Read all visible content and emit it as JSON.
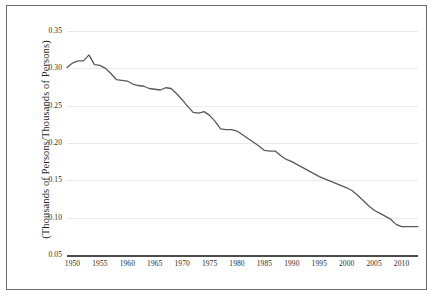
{
  "chart_data": {
    "type": "line",
    "title": "",
    "subtitle": "",
    "xlabel": "",
    "ylabel": "(Thousands of Persons/Thousands of Persons)",
    "xlim": [
      1949,
      2013
    ],
    "ylim": [
      0.05,
      0.35
    ],
    "grid": true,
    "legend": "none",
    "yticks": [
      "0.35",
      "0.30",
      "0.25",
      "0.20",
      "0.15",
      "0.10",
      "0.05"
    ],
    "ytick_values": [
      0.35,
      0.3,
      0.25,
      0.2,
      0.15,
      0.1,
      0.05
    ],
    "xticks": [
      "1950",
      "1955",
      "1960",
      "1965",
      "1970",
      "1975",
      "1980",
      "1985",
      "1990",
      "1995",
      "2000",
      "2005",
      "2010"
    ],
    "xtick_values": [
      1950,
      1955,
      1960,
      1965,
      1970,
      1975,
      1980,
      1985,
      1990,
      1995,
      2000,
      2005,
      2010
    ],
    "line_color": "#595959",
    "grid_color": "#e9e9e9",
    "axis_color": "#4a4a4a",
    "frame_color": "#6b6b6b",
    "series": [
      {
        "name": "ratio",
        "x": [
          1949,
          1950,
          1951,
          1952,
          1953,
          1954,
          1955,
          1956,
          1957,
          1958,
          1959,
          1960,
          1961,
          1962,
          1963,
          1964,
          1965,
          1966,
          1967,
          1968,
          1969,
          1970,
          1971,
          1972,
          1973,
          1974,
          1975,
          1976,
          1977,
          1978,
          1979,
          1980,
          1981,
          1982,
          1983,
          1984,
          1985,
          1986,
          1987,
          1988,
          1989,
          1990,
          1991,
          1992,
          1993,
          1994,
          1995,
          1996,
          1997,
          1998,
          1999,
          2000,
          2001,
          2002,
          2003,
          2004,
          2005,
          2006,
          2007,
          2008,
          2009,
          2010,
          2011,
          2012,
          2013
        ],
        "values": [
          0.301,
          0.307,
          0.31,
          0.31,
          0.318,
          0.305,
          0.304,
          0.3,
          0.293,
          0.285,
          0.284,
          0.283,
          0.279,
          0.277,
          0.276,
          0.273,
          0.272,
          0.271,
          0.274,
          0.273,
          0.266,
          0.258,
          0.249,
          0.241,
          0.24,
          0.242,
          0.237,
          0.229,
          0.219,
          0.218,
          0.218,
          0.216,
          0.211,
          0.206,
          0.201,
          0.196,
          0.19,
          0.189,
          0.189,
          0.183,
          0.178,
          0.175,
          0.171,
          0.167,
          0.163,
          0.159,
          0.155,
          0.152,
          0.149,
          0.146,
          0.143,
          0.14,
          0.136,
          0.13,
          0.123,
          0.116,
          0.11,
          0.106,
          0.102,
          0.098,
          0.091,
          0.088,
          0.088,
          0.088,
          0.088
        ]
      }
    ]
  }
}
